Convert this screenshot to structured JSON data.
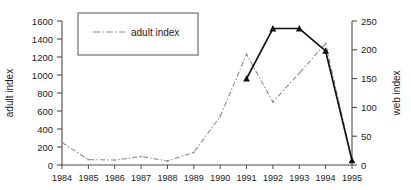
{
  "chart_data": {
    "type": "line",
    "title": "",
    "xlabel": "",
    "ylabel": "adult index",
    "y2label": "web index",
    "grid": false,
    "legend_position": "top-left",
    "legend_entries": [
      "adult index"
    ],
    "categories": [
      "1984",
      "1985",
      "1986",
      "1987",
      "1988",
      "1989",
      "1990",
      "1991",
      "1992",
      "1993",
      "1994",
      "1995"
    ],
    "x": [
      1984,
      1985,
      1986,
      1987,
      1988,
      1989,
      1990,
      1991,
      1992,
      1993,
      1994,
      1995
    ],
    "ylim": [
      0,
      1600
    ],
    "yticks": [
      0,
      200,
      400,
      600,
      800,
      1000,
      1200,
      1400,
      1600
    ],
    "y2lim": [
      0,
      250
    ],
    "y2ticks": [
      0,
      50,
      100,
      150,
      200,
      250
    ],
    "series": [
      {
        "name": "adult index",
        "axis": "left",
        "color": "#8c8c8c",
        "style": "dash-dot",
        "marker": "none",
        "x": [
          1984,
          1985,
          1986,
          1987,
          1988,
          1989,
          1990,
          1991,
          1992,
          1993,
          1994,
          1995
        ],
        "values": [
          250,
          60,
          55,
          95,
          45,
          140,
          540,
          1230,
          700,
          1020,
          1350,
          60
        ]
      },
      {
        "name": "web index",
        "axis": "right",
        "color": "#111111",
        "style": "solid",
        "marker": "triangle",
        "x": [
          1991,
          1992,
          1993,
          1994,
          1995
        ],
        "values": [
          150,
          237,
          237,
          198,
          8
        ]
      }
    ]
  },
  "axes": {
    "left_title": "adult index",
    "right_title": "web index",
    "left_ticks": [
      "0",
      "200",
      "400",
      "600",
      "800",
      "1000",
      "1200",
      "1400",
      "1600"
    ],
    "right_ticks": [
      "0",
      "50",
      "100",
      "150",
      "200",
      "250"
    ],
    "x_ticks": [
      "1984",
      "1985",
      "1986",
      "1987",
      "1988",
      "1989",
      "1990",
      "1991",
      "1992",
      "1993",
      "1994",
      "1995"
    ]
  },
  "legend": {
    "items": [
      {
        "label": "adult index",
        "color": "#8c8c8c"
      }
    ]
  },
  "colors": {
    "background": "#ffffff",
    "axis": "#4d4d4d",
    "text": "#1a1a1a",
    "series_adult": "#8c8c8c",
    "series_web": "#111111",
    "legend_border": "#555555"
  }
}
